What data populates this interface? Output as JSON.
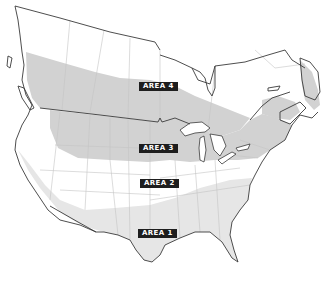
{
  "map": {
    "title": "",
    "region": "North America (Canada and United States)",
    "colors": {
      "background": "#ffffff",
      "land": "#ffffff",
      "coast": "#3a3a3a",
      "borders_internal": "#c8c8c8",
      "area_shade_dark": "#cfcfcf",
      "area_shade_light": "#e8e8e8",
      "label_bg": "#1e1e1e",
      "label_text": "#ffffff"
    },
    "areas": [
      {
        "id": "area-4",
        "label": "AREA 4",
        "x": 139,
        "y": 82
      },
      {
        "id": "area-3",
        "label": "AREA 3",
        "x": 139,
        "y": 144
      },
      {
        "id": "area-2",
        "label": "AREA 2",
        "x": 140,
        "y": 179
      },
      {
        "id": "area-1",
        "label": "AREA 1",
        "x": 138,
        "y": 229
      }
    ]
  }
}
